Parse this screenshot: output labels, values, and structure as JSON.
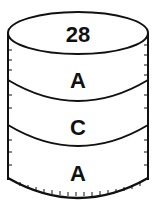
{
  "diagram": {
    "shape": "cylinder",
    "top_label": "28",
    "bands": [
      {
        "label": "A"
      },
      {
        "label": "C"
      },
      {
        "label": "A"
      }
    ],
    "stroke_color": "#111111",
    "fill_color": "#ffffff"
  }
}
